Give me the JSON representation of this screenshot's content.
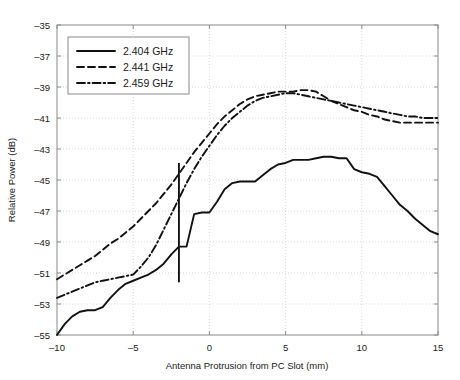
{
  "chart_data": {
    "type": "line",
    "title": "",
    "xlabel": "Antenna Protrusion from PC Slot (mm)",
    "ylabel": "Relative Power (dB)",
    "xlim": [
      -10,
      15
    ],
    "ylim": [
      -55,
      -35
    ],
    "xticks": [
      -10,
      -5,
      0,
      5,
      10,
      15
    ],
    "xticklabels": [
      "-10",
      "-5",
      "0",
      "5",
      "10",
      "15"
    ],
    "yticks": [
      -55,
      -53,
      -51,
      -49,
      -47,
      -45,
      -43,
      -41,
      -39,
      -37,
      -35
    ],
    "yticklabels": [
      "-55",
      "-53",
      "-51",
      "-49",
      "-47",
      "-45",
      "-43",
      "-41",
      "-39",
      "-37",
      "-35"
    ],
    "grid": true,
    "legend_position": "upper left",
    "series": [
      {
        "name": "2.404 GHz",
        "style": "solid",
        "x": [
          -10,
          -9.5,
          -9,
          -8.5,
          -8,
          -7.5,
          -7,
          -6.5,
          -6,
          -5.5,
          -5,
          -4.5,
          -4,
          -3.5,
          -3,
          -2.5,
          -2,
          -1.5,
          -1,
          -0.5,
          0,
          0.5,
          1,
          1.5,
          2,
          2.5,
          3,
          3.5,
          4,
          4.5,
          5,
          5.5,
          6,
          6.5,
          7,
          7.5,
          8,
          8.5,
          9,
          9.5,
          10,
          10.5,
          11,
          11.5,
          12,
          12.5,
          13,
          13.5,
          14,
          14.5,
          15
        ],
        "y": [
          -55.0,
          -54.3,
          -53.8,
          -53.5,
          -53.4,
          -53.4,
          -53.2,
          -52.6,
          -52.1,
          -51.7,
          -51.5,
          -51.3,
          -51.1,
          -50.8,
          -50.4,
          -49.8,
          -49.3,
          -49.3,
          -47.2,
          -47.1,
          -47.1,
          -46.4,
          -45.6,
          -45.2,
          -45.1,
          -45.1,
          -45.1,
          -44.7,
          -44.3,
          -44.0,
          -43.9,
          -43.7,
          -43.7,
          -43.7,
          -43.6,
          -43.5,
          -43.5,
          -43.6,
          -43.6,
          -44.3,
          -44.5,
          -44.6,
          -44.8,
          -45.4,
          -46.0,
          -46.6,
          -47.0,
          -47.5,
          -47.9,
          -48.3,
          -48.5
        ]
      },
      {
        "name": "2.441 GHz",
        "style": "dashed",
        "x": [
          -10,
          -9.5,
          -9,
          -8.5,
          -8,
          -7.5,
          -7,
          -6.5,
          -6,
          -5.5,
          -5,
          -4.5,
          -4,
          -3.5,
          -3,
          -2.5,
          -2,
          -1.5,
          -1,
          -0.5,
          0,
          0.5,
          1,
          1.5,
          2,
          2.5,
          3,
          3.5,
          4,
          4.5,
          5,
          5.5,
          6,
          6.5,
          7,
          7.5,
          8,
          8.5,
          9,
          9.5,
          10,
          10.5,
          11,
          11.5,
          12,
          12.5,
          13,
          13.5,
          14,
          14.5,
          15
        ],
        "y": [
          -51.4,
          -51.1,
          -50.8,
          -50.5,
          -50.2,
          -49.9,
          -49.5,
          -49.1,
          -48.8,
          -48.4,
          -48.0,
          -47.5,
          -47.0,
          -46.5,
          -45.9,
          -45.3,
          -44.6,
          -43.9,
          -43.2,
          -42.6,
          -42.0,
          -41.4,
          -40.9,
          -40.5,
          -40.1,
          -39.8,
          -39.6,
          -39.5,
          -39.4,
          -39.3,
          -39.3,
          -39.3,
          -39.2,
          -39.2,
          -39.3,
          -39.6,
          -39.9,
          -40.1,
          -40.3,
          -40.5,
          -40.6,
          -40.8,
          -40.9,
          -41.1,
          -41.2,
          -41.3,
          -41.3,
          -41.3,
          -41.3,
          -41.3,
          -41.3
        ]
      },
      {
        "name": "2.459 GHz",
        "style": "dashdot",
        "x": [
          -10,
          -9.5,
          -9,
          -8.5,
          -8,
          -7.5,
          -7,
          -6.5,
          -6,
          -5.5,
          -5,
          -4.5,
          -4,
          -3.5,
          -3,
          -2.5,
          -2,
          -1.5,
          -1,
          -0.5,
          0,
          0.5,
          1,
          1.5,
          2,
          2.5,
          3,
          3.5,
          4,
          4.5,
          5,
          5.5,
          6,
          6.5,
          7,
          7.5,
          8,
          8.5,
          9,
          9.5,
          10,
          10.5,
          11,
          11.5,
          12,
          12.5,
          13,
          13.5,
          14,
          14.5,
          15
        ],
        "y": [
          -52.6,
          -52.4,
          -52.2,
          -52.0,
          -51.8,
          -51.6,
          -51.5,
          -51.4,
          -51.3,
          -51.2,
          -51.1,
          -50.6,
          -50.0,
          -49.2,
          -48.2,
          -47.2,
          -46.2,
          -45.2,
          -44.3,
          -43.5,
          -42.8,
          -42.1,
          -41.5,
          -41.0,
          -40.6,
          -40.2,
          -39.9,
          -39.7,
          -39.6,
          -39.5,
          -39.4,
          -39.4,
          -39.5,
          -39.6,
          -39.7,
          -39.8,
          -39.9,
          -40.0,
          -40.1,
          -40.2,
          -40.3,
          -40.4,
          -40.5,
          -40.6,
          -40.7,
          -40.8,
          -40.9,
          -40.9,
          -41.0,
          -41.0,
          -41.0
        ]
      }
    ],
    "annotations": [
      {
        "name": "vertical-marker",
        "type": "vline",
        "x": -2.0,
        "y_start": -51.6,
        "y_end": -43.9
      }
    ]
  },
  "legend": {
    "entries": [
      {
        "label": "2.404 GHz"
      },
      {
        "label": "2.441 GHz"
      },
      {
        "label": "2.459 GHz"
      }
    ]
  },
  "colors": {
    "line": "#111111",
    "grid": "#c8c8c8",
    "frame": "#8a8a8a",
    "background": "#ffffff"
  }
}
